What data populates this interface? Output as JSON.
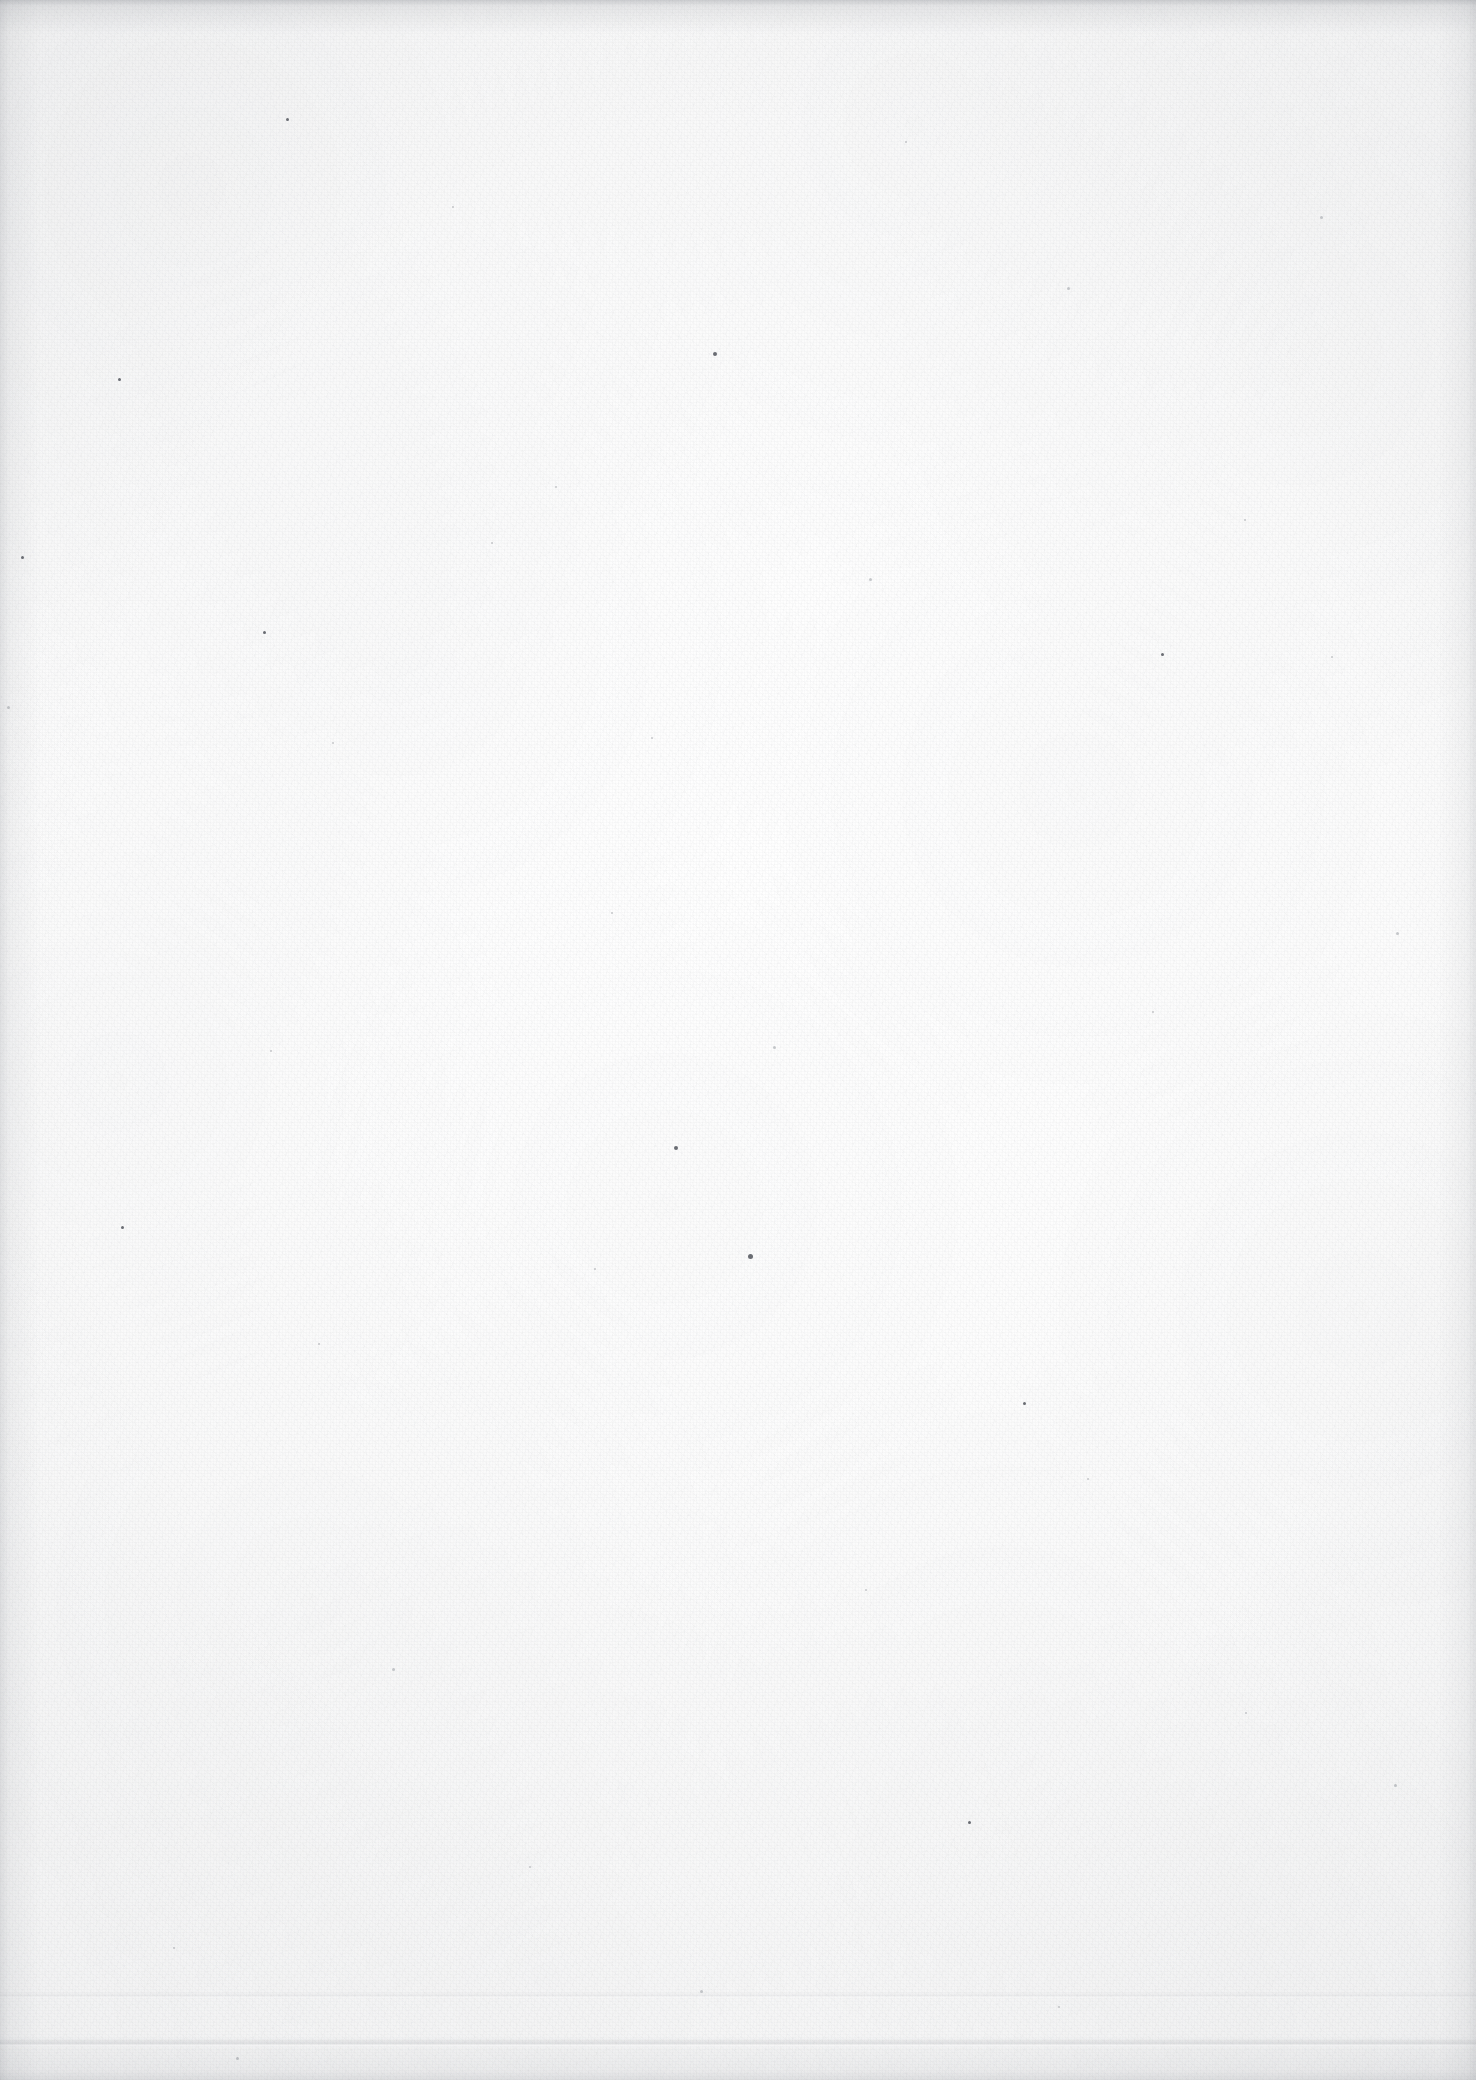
{
  "document": {
    "kind": "scanned-page",
    "content_text": "",
    "page_width": 1476,
    "page_height": 2080,
    "background_color": "#fdfdfd",
    "paper_tone": "#fafafa",
    "grain_color": "#787c84",
    "edge_shadow_color": "#6c7078",
    "speck_color": "#3a3e46",
    "notes": "Blank scanned sheet: paper grain, scattered specks, faint bottom crease, darker scan edges."
  },
  "artifacts": {
    "crease_main_y": 2038,
    "crease_faint_y": 1992,
    "specks": [
      {
        "x": 286,
        "y": 118,
        "size": 3,
        "tone": "dark"
      },
      {
        "x": 713,
        "y": 352,
        "size": 4,
        "tone": "dark"
      },
      {
        "x": 118,
        "y": 378,
        "size": 3,
        "tone": "dark"
      },
      {
        "x": 1320,
        "y": 216,
        "size": 3,
        "tone": "soft"
      },
      {
        "x": 905,
        "y": 141,
        "size": 2,
        "tone": "soft"
      },
      {
        "x": 452,
        "y": 206,
        "size": 2,
        "tone": "soft"
      },
      {
        "x": 1067,
        "y": 287,
        "size": 3,
        "tone": "soft"
      },
      {
        "x": 263,
        "y": 631,
        "size": 3,
        "tone": "dark"
      },
      {
        "x": 555,
        "y": 486,
        "size": 2,
        "tone": "soft"
      },
      {
        "x": 869,
        "y": 578,
        "size": 3,
        "tone": "soft"
      },
      {
        "x": 1244,
        "y": 519,
        "size": 2,
        "tone": "soft"
      },
      {
        "x": 1161,
        "y": 653,
        "size": 3,
        "tone": "dark"
      },
      {
        "x": 21,
        "y": 556,
        "size": 3,
        "tone": "dark"
      },
      {
        "x": 7,
        "y": 706,
        "size": 3,
        "tone": "soft"
      },
      {
        "x": 332,
        "y": 742,
        "size": 2,
        "tone": "soft"
      },
      {
        "x": 651,
        "y": 737,
        "size": 2,
        "tone": "soft"
      },
      {
        "x": 1331,
        "y": 656,
        "size": 2,
        "tone": "soft"
      },
      {
        "x": 491,
        "y": 542,
        "size": 2,
        "tone": "soft"
      },
      {
        "x": 674,
        "y": 1146,
        "size": 4,
        "tone": "dark"
      },
      {
        "x": 1023,
        "y": 1402,
        "size": 3,
        "tone": "dark"
      },
      {
        "x": 773,
        "y": 1046,
        "size": 3,
        "tone": "soft"
      },
      {
        "x": 270,
        "y": 1050,
        "size": 2,
        "tone": "soft"
      },
      {
        "x": 1396,
        "y": 932,
        "size": 3,
        "tone": "soft"
      },
      {
        "x": 594,
        "y": 1268,
        "size": 2,
        "tone": "soft"
      },
      {
        "x": 121,
        "y": 1226,
        "size": 3,
        "tone": "dark"
      },
      {
        "x": 748,
        "y": 1254,
        "size": 5,
        "tone": "dark"
      },
      {
        "x": 318,
        "y": 1343,
        "size": 2,
        "tone": "soft"
      },
      {
        "x": 1087,
        "y": 1478,
        "size": 2,
        "tone": "soft"
      },
      {
        "x": 865,
        "y": 1589,
        "size": 2,
        "tone": "soft"
      },
      {
        "x": 392,
        "y": 1668,
        "size": 3,
        "tone": "soft"
      },
      {
        "x": 1245,
        "y": 1712,
        "size": 2,
        "tone": "soft"
      },
      {
        "x": 968,
        "y": 1821,
        "size": 3,
        "tone": "dark"
      },
      {
        "x": 529,
        "y": 1866,
        "size": 2,
        "tone": "soft"
      },
      {
        "x": 1394,
        "y": 1784,
        "size": 3,
        "tone": "soft"
      },
      {
        "x": 173,
        "y": 1947,
        "size": 2,
        "tone": "soft"
      },
      {
        "x": 700,
        "y": 1990,
        "size": 3,
        "tone": "soft"
      },
      {
        "x": 1058,
        "y": 2006,
        "size": 2,
        "tone": "soft"
      },
      {
        "x": 236,
        "y": 2057,
        "size": 3,
        "tone": "soft"
      },
      {
        "x": 611,
        "y": 912,
        "size": 2,
        "tone": "soft"
      },
      {
        "x": 1152,
        "y": 1011,
        "size": 2,
        "tone": "soft"
      }
    ]
  }
}
